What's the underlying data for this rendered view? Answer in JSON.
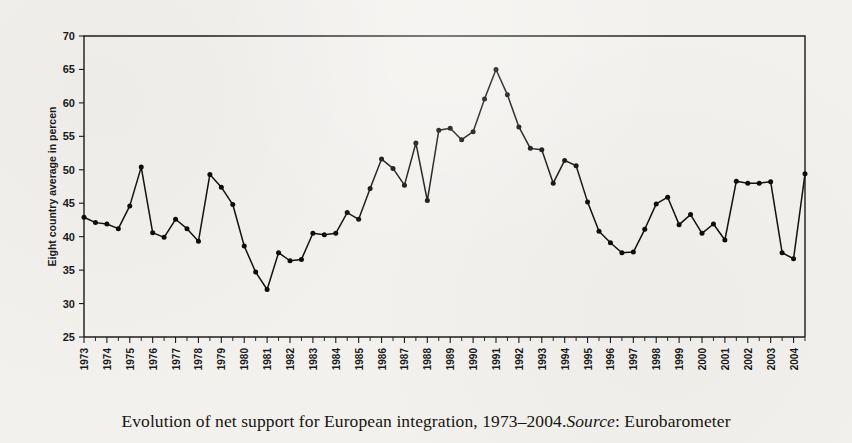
{
  "caption": {
    "main": "Evolution of net support for European integration, 1973–2004. ",
    "source_label": "Source",
    "source_value": ": Eurobarometer"
  },
  "axes": {
    "y_title": "Eight country average in percen",
    "y_ticks": [
      "25",
      "30",
      "35",
      "40",
      "45",
      "50",
      "55",
      "60",
      "65",
      "70"
    ],
    "x_ticks": [
      "1973",
      "1974",
      "1975",
      "1976",
      "1977",
      "1978",
      "1979",
      "1980",
      "1981",
      "1982",
      "1983",
      "1984",
      "1985",
      "1986",
      "1987",
      "1988",
      "1989",
      "1990",
      "1991",
      "1992",
      "1993",
      "1994",
      "1995",
      "1996",
      "1997",
      "1998",
      "1999",
      "2000",
      "2001",
      "2002",
      "2003",
      "2004"
    ]
  },
  "colors": {
    "line": "#121210",
    "marker": "#0d0d0b",
    "axis": "#1d1c1a",
    "paper": "#f2f1ee"
  },
  "chart_data": {
    "type": "line",
    "title": "",
    "subtitle": "",
    "xlabel": "",
    "ylabel": "Eight country average in percen",
    "ylim": [
      25,
      70
    ],
    "xlim": [
      1973,
      2004.5
    ],
    "grid": false,
    "legend": false,
    "y_tick_step": 5,
    "observation_frequency": "semi-annual",
    "marker": "filled-circle",
    "categories": [
      "1973",
      "1974",
      "1975",
      "1976",
      "1977",
      "1978",
      "1979",
      "1980",
      "1981",
      "1982",
      "1983",
      "1984",
      "1985",
      "1986",
      "1987",
      "1988",
      "1989",
      "1990",
      "1991",
      "1992",
      "1993",
      "1994",
      "1995",
      "1996",
      "1997",
      "1998",
      "1999",
      "2000",
      "2001",
      "2002",
      "2003",
      "2004"
    ],
    "series": [
      {
        "name": "Eight country average net support",
        "points": [
          {
            "x": 1973.0,
            "y": 42.9
          },
          {
            "x": 1973.5,
            "y": 42.1
          },
          {
            "x": 1974.0,
            "y": 41.9
          },
          {
            "x": 1974.5,
            "y": 41.2
          },
          {
            "x": 1975.0,
            "y": 44.6
          },
          {
            "x": 1975.5,
            "y": 50.4
          },
          {
            "x": 1976.0,
            "y": 40.6
          },
          {
            "x": 1976.5,
            "y": 39.9
          },
          {
            "x": 1977.0,
            "y": 42.6
          },
          {
            "x": 1977.5,
            "y": 41.2
          },
          {
            "x": 1978.0,
            "y": 39.3
          },
          {
            "x": 1978.5,
            "y": 49.3
          },
          {
            "x": 1979.0,
            "y": 47.4
          },
          {
            "x": 1979.5,
            "y": 44.8
          },
          {
            "x": 1980.0,
            "y": 38.6
          },
          {
            "x": 1980.5,
            "y": 34.7
          },
          {
            "x": 1981.0,
            "y": 32.1
          },
          {
            "x": 1981.5,
            "y": 37.6
          },
          {
            "x": 1982.0,
            "y": 36.4
          },
          {
            "x": 1982.5,
            "y": 36.6
          },
          {
            "x": 1983.0,
            "y": 40.5
          },
          {
            "x": 1983.5,
            "y": 40.3
          },
          {
            "x": 1984.0,
            "y": 40.5
          },
          {
            "x": 1984.5,
            "y": 43.6
          },
          {
            "x": 1985.0,
            "y": 42.6
          },
          {
            "x": 1985.5,
            "y": 47.2
          },
          {
            "x": 1986.0,
            "y": 51.6
          },
          {
            "x": 1986.5,
            "y": 50.2
          },
          {
            "x": 1987.0,
            "y": 47.7
          },
          {
            "x": 1987.5,
            "y": 54.0
          },
          {
            "x": 1988.0,
            "y": 45.4
          },
          {
            "x": 1988.5,
            "y": 55.9
          },
          {
            "x": 1989.0,
            "y": 56.2
          },
          {
            "x": 1989.5,
            "y": 54.5
          },
          {
            "x": 1990.0,
            "y": 55.7
          },
          {
            "x": 1990.5,
            "y": 60.6
          },
          {
            "x": 1991.0,
            "y": 65.0
          },
          {
            "x": 1991.5,
            "y": 61.2
          },
          {
            "x": 1992.0,
            "y": 56.4
          },
          {
            "x": 1992.5,
            "y": 53.2
          },
          {
            "x": 1993.0,
            "y": 53.0
          },
          {
            "x": 1993.5,
            "y": 48.0
          },
          {
            "x": 1994.0,
            "y": 51.4
          },
          {
            "x": 1994.5,
            "y": 50.6
          },
          {
            "x": 1995.0,
            "y": 45.2
          },
          {
            "x": 1995.5,
            "y": 40.8
          },
          {
            "x": 1996.0,
            "y": 39.1
          },
          {
            "x": 1996.5,
            "y": 37.6
          },
          {
            "x": 1997.0,
            "y": 37.7
          },
          {
            "x": 1997.5,
            "y": 41.1
          },
          {
            "x": 1998.0,
            "y": 44.9
          },
          {
            "x": 1998.5,
            "y": 45.9
          },
          {
            "x": 1999.0,
            "y": 41.8
          },
          {
            "x": 1999.5,
            "y": 43.3
          },
          {
            "x": 2000.0,
            "y": 40.5
          },
          {
            "x": 2000.5,
            "y": 41.9
          },
          {
            "x": 2001.0,
            "y": 39.5
          },
          {
            "x": 2001.5,
            "y": 48.3
          },
          {
            "x": 2002.0,
            "y": 48.0
          },
          {
            "x": 2002.5,
            "y": 48.0
          },
          {
            "x": 2003.0,
            "y": 48.2
          },
          {
            "x": 2003.5,
            "y": 37.6
          },
          {
            "x": 2004.0,
            "y": 36.7
          },
          {
            "x": 2004.5,
            "y": 49.4
          }
        ]
      }
    ],
    "annotations": {
      "maximum": {
        "value": 65.0,
        "year": "1991"
      },
      "minimum": {
        "value": 32.1,
        "year": "1981"
      }
    }
  }
}
